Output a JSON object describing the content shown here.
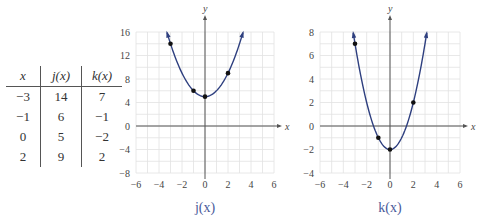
{
  "table": {
    "headers": [
      "x",
      "j(x)",
      "k(x)"
    ],
    "rows": [
      [
        "−3",
        "14",
        "7"
      ],
      [
        "−1",
        "6",
        "−1"
      ],
      [
        "0",
        "5",
        "−2"
      ],
      [
        "2",
        "9",
        "2"
      ]
    ]
  },
  "colors": {
    "curve": "#2e3f7f",
    "caption": "#4a5a9a",
    "grid": "#e2e2e2",
    "axis": "#555555"
  },
  "chart_data": [
    {
      "type": "line",
      "title": "j(x)",
      "caption": "j(x)",
      "xlabel": "x",
      "ylabel": "y",
      "xlim": [
        -6,
        6
      ],
      "ylim": [
        -8,
        16
      ],
      "xticks": [
        -6,
        -4,
        -2,
        0,
        2,
        4,
        6
      ],
      "yticks": [
        -8,
        -4,
        0,
        4,
        8,
        12,
        16
      ],
      "grid": true,
      "function": "x^2 + 5",
      "points": [
        [
          -3,
          14
        ],
        [
          -1,
          6
        ],
        [
          0,
          5
        ],
        [
          2,
          9
        ]
      ],
      "curve_range": [
        -3.3,
        3.3
      ]
    },
    {
      "type": "line",
      "title": "k(x)",
      "caption": "k(x)",
      "xlabel": "x",
      "ylabel": "y",
      "xlim": [
        -6,
        6
      ],
      "ylim": [
        -4,
        8
      ],
      "xticks": [
        -6,
        -4,
        -2,
        0,
        2,
        4,
        6
      ],
      "yticks": [
        -4,
        -2,
        0,
        2,
        4,
        6,
        8
      ],
      "grid": true,
      "function": "x^2 - 2",
      "points": [
        [
          -3,
          7
        ],
        [
          -1,
          -1
        ],
        [
          0,
          -2
        ],
        [
          2,
          2
        ]
      ],
      "curve_range": [
        -3.15,
        3.15
      ]
    }
  ]
}
